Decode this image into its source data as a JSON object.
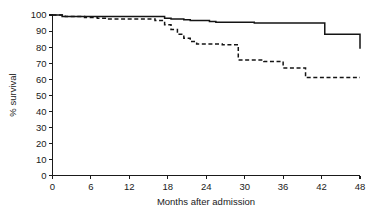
{
  "figure": {
    "background_color": "#ffffff",
    "ink_color": "#141414"
  },
  "chart_data": {
    "type": "line",
    "title": "",
    "subtitle": "",
    "xlabel": "Months after admission",
    "ylabel": "% survival",
    "xlim": [
      0,
      48
    ],
    "ylim": [
      0,
      100
    ],
    "xticks": [
      0,
      6,
      12,
      18,
      24,
      30,
      36,
      42,
      48
    ],
    "xtick_labels": [
      "0",
      "6",
      "12",
      "18",
      "24",
      "30",
      "36",
      "42",
      "48"
    ],
    "yticks": [
      0,
      10,
      20,
      30,
      40,
      50,
      60,
      70,
      80,
      90,
      100
    ],
    "ytick_labels": [
      "0",
      "10",
      "20",
      "30",
      "40",
      "50",
      "60",
      "70",
      "80",
      "90",
      "100"
    ],
    "grid": false,
    "legend": "none",
    "interpolation": "step-after",
    "series": [
      {
        "name": "solid-curve",
        "style": "solid",
        "color": "#141414",
        "x": [
          0,
          1.5,
          16.5,
          17.5,
          18.5,
          20.5,
          21.5,
          24.5,
          25.5,
          31.5,
          42.5,
          48
        ],
        "y": [
          100,
          99,
          99,
          98,
          97.5,
          97,
          96.5,
          96,
          95.5,
          95,
          88,
          88
        ],
        "values": [
          100,
          99,
          99,
          98,
          97.5,
          97,
          96.5,
          96,
          95.5,
          95,
          88,
          88
        ],
        "final_value": 79
      },
      {
        "name": "dashed-curve",
        "style": "dashed",
        "color": "#141414",
        "x": [
          0,
          2,
          5,
          7,
          8.5,
          16,
          17.5,
          18.5,
          19.5,
          20.5,
          21.5,
          22.5,
          26.5,
          29,
          33,
          36,
          39.5,
          48
        ],
        "y": [
          100,
          99,
          98.5,
          98,
          97.5,
          96.5,
          94,
          91,
          88,
          85.5,
          83.5,
          82,
          81.5,
          72,
          71,
          67,
          61,
          61
        ],
        "values": [
          100,
          99,
          98.5,
          98,
          97.5,
          96.5,
          94,
          91,
          88,
          85.5,
          83.5,
          82,
          81.5,
          72,
          71,
          67,
          61,
          61
        ],
        "final_value": 61
      }
    ]
  },
  "axes": {
    "y_axis_label": "% survival",
    "x_axis_label": "Months after admission"
  }
}
